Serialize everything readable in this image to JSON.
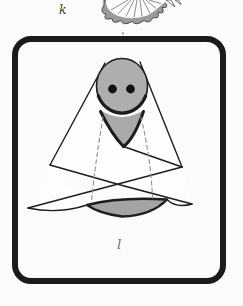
{
  "page": {
    "background": "#fbfbfb"
  },
  "top_figure": {
    "label": "k",
    "illustration": "ruffled-skirt-hem-partial"
  },
  "framed_figure": {
    "label": "l",
    "illustration": "doll-wrapped-in-white-shawl"
  },
  "colors": {
    "page": "#fbfbfb",
    "frame": "#1a1a1a",
    "cloth": "#fdfdfd",
    "outline": "#1d1d1d",
    "head": "#aeaeae",
    "vneck": "#a9a9a9",
    "eye": "#111111",
    "base": "#a3a3a3",
    "dash": "#8f8f8f",
    "frill": "#9a9a9a",
    "frill-line": "#6f6f6f",
    "label-top": "#3f3f3f",
    "label-bottom": "#6f6f6f"
  }
}
